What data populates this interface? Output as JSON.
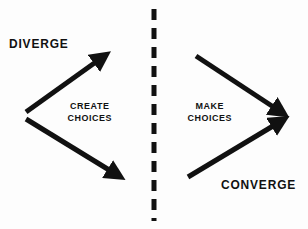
{
  "diagram": {
    "background_color": "#fdfdfd",
    "ink_color": "#111111",
    "labels": {
      "diverge": "DIVERGE",
      "converge": "CONVERGE",
      "create_choices_line1": "CREATE",
      "create_choices_line2": "CHOICES",
      "make_choices_line1": "MAKE",
      "make_choices_line2": "CHOICES"
    },
    "divider": {
      "name": "dashed-divider",
      "orientation": "vertical",
      "x": 154,
      "y_start": 8,
      "y_end": 222,
      "dash_length": 11,
      "gap_length": 8,
      "thickness": 5,
      "color": "#111111"
    },
    "arrows": [
      {
        "name": "diverge-up-arrow",
        "direction": "up-right",
        "x1": 26,
        "y1": 112,
        "x2": 104,
        "y2": 56,
        "thickness": 5,
        "color": "#111111"
      },
      {
        "name": "diverge-down-arrow",
        "direction": "down-right",
        "x1": 26,
        "y1": 119,
        "x2": 119,
        "y2": 177,
        "thickness": 5,
        "color": "#111111"
      },
      {
        "name": "converge-down-arrow",
        "direction": "down-right",
        "x1": 196,
        "y1": 56,
        "x2": 283,
        "y2": 113,
        "thickness": 5,
        "color": "#111111"
      },
      {
        "name": "converge-up-arrow",
        "direction": "up-right",
        "x1": 188,
        "y1": 177,
        "x2": 283,
        "y2": 120,
        "thickness": 5,
        "color": "#111111"
      }
    ]
  }
}
